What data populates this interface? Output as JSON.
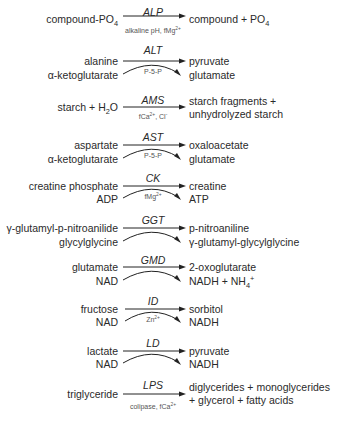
{
  "diagram": {
    "type": "enzyme-reactions",
    "reactions": [
      {
        "enzyme": "ALP",
        "substrates": [
          "compound-PO4"
        ],
        "products": [
          "compound + PO4"
        ],
        "cofactor": "alkaline pH, fMg2+",
        "double_arrow": false
      },
      {
        "enzyme": "ALT",
        "substrates": [
          "alanine",
          "α-ketoglutarate"
        ],
        "products": [
          "pyruvate",
          "glutamate"
        ],
        "cofactor": "P-5-P",
        "double_arrow": true
      },
      {
        "enzyme": "AMS",
        "substrates": [
          "starch + H2O"
        ],
        "products": [
          "starch fragments +",
          "unhydrolyzed starch"
        ],
        "cofactor": "fCa2+, Cl-",
        "double_arrow": false
      },
      {
        "enzyme": "AST",
        "substrates": [
          "aspartate",
          "α-ketoglutarate"
        ],
        "products": [
          "oxaloacetate",
          "glutamate"
        ],
        "cofactor": "P-5-P",
        "double_arrow": true
      },
      {
        "enzyme": "CK",
        "substrates": [
          "creatine phosphate",
          "ADP"
        ],
        "products": [
          "creatine",
          "ATP"
        ],
        "cofactor": "fMg2+",
        "double_arrow": true
      },
      {
        "enzyme": "GGT",
        "substrates": [
          "γ-glutamyl-p-nitroanilide",
          "glycylglycine"
        ],
        "products": [
          "p-nitroaniline",
          "γ-glutamyl-glycylglycine"
        ],
        "cofactor": "",
        "double_arrow": true
      },
      {
        "enzyme": "GMD",
        "substrates": [
          "glutamate",
          "NAD"
        ],
        "products": [
          "2-oxoglutarate",
          "NADH + NH4+"
        ],
        "cofactor": "",
        "double_arrow": true
      },
      {
        "enzyme": "ID",
        "substrates": [
          "fructose",
          "NAD"
        ],
        "products": [
          "sorbitol",
          "NADH"
        ],
        "cofactor": "Zn2+",
        "double_arrow": true
      },
      {
        "enzyme": "LD",
        "substrates": [
          "lactate",
          "NAD"
        ],
        "products": [
          "pyruvate",
          "NADH"
        ],
        "cofactor": "",
        "double_arrow": true
      },
      {
        "enzyme": "LPS",
        "substrates": [
          "triglyceride"
        ],
        "products": [
          "diglycerides + monoglycerides",
          "+ glycerol + fatty acids"
        ],
        "cofactor": "colipase, fCa2+",
        "double_arrow": false
      }
    ]
  },
  "r": {
    "alp": {
      "enz": "ALP",
      "s1a": "compound-PO",
      "s1b": "4",
      "p1a": "compound + PO",
      "p1b": "4",
      "c_a": "alkaline pH, fMg",
      "c_b": "2+"
    },
    "alt": {
      "enz": "ALT",
      "s1": "alanine",
      "s2": "α-ketoglutarate",
      "p1": "pyruvate",
      "p2": "glutamate",
      "c": "P-5-P"
    },
    "ams": {
      "enz": "AMS",
      "s1a": "starch + H",
      "s1b": "2",
      "s1c": "O",
      "p1": "starch fragments +",
      "p2": "unhydrolyzed starch",
      "c_a": "fCa",
      "c_b": "2+",
      "c_c": ", Cl",
      "c_d": "-"
    },
    "ast": {
      "enz": "AST",
      "s1": "aspartate",
      "s2": "α-ketoglutarate",
      "p1": "oxaloacetate",
      "p2": "glutamate",
      "c": "P-5-P"
    },
    "ck": {
      "enz": "CK",
      "s1": "creatine phosphate",
      "s2": "ADP",
      "p1": "creatine",
      "p2": "ATP",
      "c_a": "fMg",
      "c_b": "2+"
    },
    "ggt": {
      "enz": "GGT",
      "s1": "γ-glutamyl-p-nitroanilide",
      "s2": "glycylglycine",
      "p1": "p-nitroaniline",
      "p2": "γ-glutamyl-glycylglycine"
    },
    "gmd": {
      "enz": "GMD",
      "s1": "glutamate",
      "s2": "NAD",
      "p1": "2-oxoglutarate",
      "p2a": "NADH + NH",
      "p2b": "4",
      "p2c": "+"
    },
    "id": {
      "enz": "ID",
      "s1": "fructose",
      "s2": "NAD",
      "p1": "sorbitol",
      "p2": "NADH",
      "c_a": "Zn",
      "c_b": "2+"
    },
    "ld": {
      "enz": "LD",
      "s1": "lactate",
      "s2": "NAD",
      "p1": "pyruvate",
      "p2": "NADH"
    },
    "lps": {
      "enz": "LPS",
      "s1": "triglyceride",
      "p1": "diglycerides + monoglycerides",
      "p2": "+ glycerol + fatty acids",
      "c_a": "colipase, fCa",
      "c_b": "2+"
    }
  },
  "colors": {
    "text": "#2a2a2a",
    "arrow": "#222222",
    "cofactor": "#555555"
  }
}
